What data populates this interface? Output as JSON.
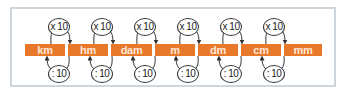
{
  "diagram": {
    "units": [
      "km",
      "hm",
      "dam",
      "m",
      "dm",
      "cm",
      "mm"
    ],
    "multiply_label": "x 10",
    "divide_label": ": 10",
    "colors": {
      "bar": "#e8782a",
      "bar_text": "#fde9da",
      "frame_border": "#cfd6db",
      "arrow": "#333333"
    }
  }
}
